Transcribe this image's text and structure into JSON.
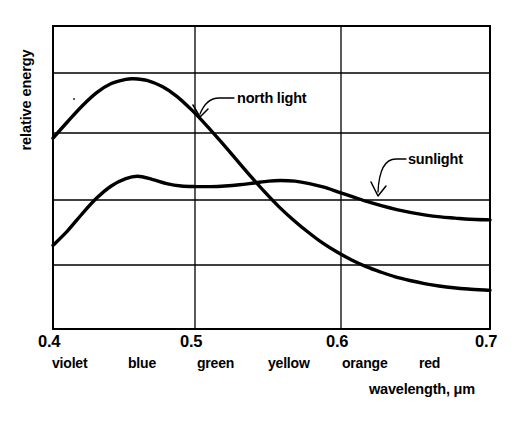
{
  "axes": {
    "ylabel": "relative energy",
    "xlabel": "wavelength, μm",
    "xticks": [
      "0.4",
      "0.5",
      "0.6",
      "0.7"
    ],
    "color_bands": [
      "violet",
      "blue",
      "green",
      "yellow",
      "orange",
      "red"
    ]
  },
  "annotations": {
    "north_light": "north light",
    "sunlight": "sunlight"
  },
  "chart_data": {
    "type": "line",
    "title": "",
    "xlabel": "wavelength, μm",
    "ylabel": "relative energy",
    "xlim": [
      0.4,
      0.7
    ],
    "ylim": [
      0,
      5
    ],
    "xticks": [
      0.4,
      0.5,
      0.6,
      0.7
    ],
    "yticks": [
      0,
      1,
      2,
      3,
      4,
      5
    ],
    "ytick_labels": [
      "",
      "",
      "",
      "",
      "",
      ""
    ],
    "grid": true,
    "legend": "inline-annotations",
    "band_labels": [
      "violet",
      "blue",
      "green",
      "yellow",
      "orange",
      "red"
    ],
    "band_label_x": [
      0.417,
      0.468,
      0.515,
      0.563,
      0.61,
      0.652
    ],
    "series": [
      {
        "name": "north light",
        "x": [
          0.4,
          0.41,
          0.42,
          0.43,
          0.44,
          0.45,
          0.455,
          0.465,
          0.475,
          0.485,
          0.495,
          0.505,
          0.515,
          0.525,
          0.535,
          0.545,
          0.555,
          0.565,
          0.575,
          0.585,
          0.595,
          0.605,
          0.615,
          0.625,
          0.635,
          0.645,
          0.655,
          0.665,
          0.675,
          0.685,
          0.7
        ],
        "y": [
          3.15,
          3.42,
          3.68,
          3.9,
          4.05,
          4.12,
          4.13,
          4.1,
          4.0,
          3.84,
          3.62,
          3.37,
          3.1,
          2.82,
          2.54,
          2.27,
          2.02,
          1.8,
          1.6,
          1.42,
          1.27,
          1.14,
          1.03,
          0.94,
          0.86,
          0.8,
          0.75,
          0.71,
          0.68,
          0.66,
          0.64
        ]
      },
      {
        "name": "sunlight",
        "x": [
          0.4,
          0.41,
          0.42,
          0.43,
          0.44,
          0.45,
          0.458,
          0.468,
          0.478,
          0.488,
          0.498,
          0.508,
          0.518,
          0.528,
          0.538,
          0.548,
          0.556,
          0.566,
          0.576,
          0.586,
          0.596,
          0.606,
          0.616,
          0.626,
          0.636,
          0.646,
          0.656,
          0.666,
          0.676,
          0.686,
          0.7
        ],
        "y": [
          1.38,
          1.62,
          1.9,
          2.16,
          2.36,
          2.48,
          2.52,
          2.47,
          2.4,
          2.36,
          2.35,
          2.35,
          2.36,
          2.38,
          2.41,
          2.44,
          2.45,
          2.44,
          2.4,
          2.34,
          2.26,
          2.18,
          2.1,
          2.03,
          1.97,
          1.92,
          1.88,
          1.85,
          1.83,
          1.81,
          1.8
        ]
      }
    ]
  },
  "plot_geometry": {
    "left": 53,
    "right": 490,
    "top": 26,
    "bottom": 329,
    "vgrid_x": [
      53,
      195,
      341,
      490
    ],
    "hgrid_y": [
      26,
      73,
      133,
      200,
      265,
      329
    ]
  },
  "colors": {
    "ink": "#000000",
    "grid": "#000000",
    "background": "#ffffff"
  }
}
